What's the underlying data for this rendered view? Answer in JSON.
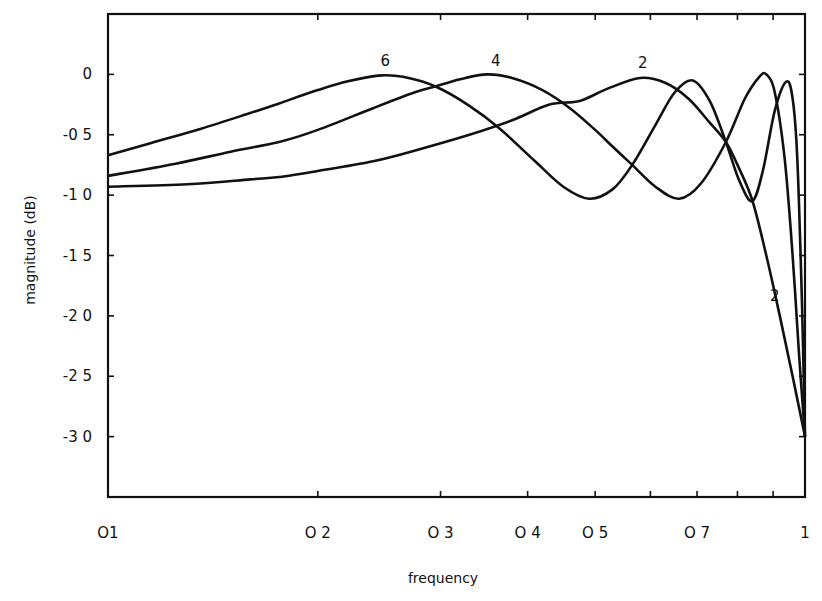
{
  "chart_data": {
    "type": "line",
    "title": "",
    "xlabel": "frequency",
    "ylabel": "magnitude (dB)",
    "xscale": "log",
    "xlim": [
      0.1,
      1.0
    ],
    "ylim": [
      -3.5,
      0.5
    ],
    "grid": false,
    "legend": "none (curves labeled inline)",
    "x_ticks": [
      0.1,
      0.2,
      0.3,
      0.4,
      0.5,
      0.6,
      0.7,
      0.8,
      0.9,
      1.0
    ],
    "x_tick_labels": [
      {
        "value": 0.1,
        "label": "O1"
      },
      {
        "value": 0.2,
        "label": "O 2"
      },
      {
        "value": 0.3,
        "label": "O 3"
      },
      {
        "value": 0.4,
        "label": "O 4"
      },
      {
        "value": 0.5,
        "label": "O 5"
      },
      {
        "value": 0.7,
        "label": "O 7"
      },
      {
        "value": 1.0,
        "label": "1"
      }
    ],
    "y_ticks": [
      0,
      -0.5,
      -1.0,
      -1.5,
      -2.0,
      -2.5,
      -3.0
    ],
    "y_tick_labels": [
      {
        "value": 0,
        "label": "0"
      },
      {
        "value": -0.5,
        "label": "-0 5"
      },
      {
        "value": -1.0,
        "label": "-1 0"
      },
      {
        "value": -1.5,
        "label": "-1 5"
      },
      {
        "value": -2.0,
        "label": "-2 0"
      },
      {
        "value": -2.5,
        "label": "-2 5"
      },
      {
        "value": -3.0,
        "label": "-3 0"
      }
    ],
    "series": [
      {
        "name": "6",
        "x": [
          0.1,
          0.115,
          0.136,
          0.16,
          0.176,
          0.2,
          0.22,
          0.244,
          0.265,
          0.295,
          0.33,
          0.365,
          0.41,
          0.45,
          0.49,
          0.53,
          0.565,
          0.61,
          0.65,
          0.69,
          0.73,
          0.77,
          0.805,
          0.84,
          0.87,
          0.905,
          0.94,
          0.96,
          0.975,
          0.99,
          1.0
        ],
        "values": [
          -0.67,
          -0.57,
          -0.45,
          -0.32,
          -0.24,
          -0.13,
          -0.06,
          -0.01,
          -0.02,
          -0.1,
          -0.26,
          -0.45,
          -0.72,
          -0.93,
          -1.03,
          -0.95,
          -0.75,
          -0.42,
          -0.15,
          -0.05,
          -0.22,
          -0.56,
          -0.88,
          -1.05,
          -0.8,
          -0.3,
          -0.06,
          -0.2,
          -0.7,
          -1.9,
          -3.0
        ]
      },
      {
        "name": "4",
        "x": [
          0.1,
          0.125,
          0.15,
          0.176,
          0.2,
          0.24,
          0.275,
          0.295,
          0.32,
          0.35,
          0.38,
          0.42,
          0.46,
          0.5,
          0.53,
          0.565,
          0.61,
          0.66,
          0.71,
          0.77,
          0.82,
          0.86,
          0.88,
          0.905,
          0.935,
          0.96,
          0.98,
          1.0
        ],
        "values": [
          -0.84,
          -0.74,
          -0.64,
          -0.56,
          -0.46,
          -0.28,
          -0.15,
          -0.1,
          -0.04,
          0.0,
          -0.03,
          -0.13,
          -0.28,
          -0.46,
          -0.6,
          -0.75,
          -0.93,
          -1.03,
          -0.9,
          -0.56,
          -0.2,
          -0.02,
          0.0,
          -0.15,
          -0.7,
          -1.5,
          -2.3,
          -3.0
        ]
      },
      {
        "name": "2",
        "x": [
          0.1,
          0.13,
          0.16,
          0.176,
          0.2,
          0.24,
          0.28,
          0.33,
          0.38,
          0.43,
          0.475,
          0.52,
          0.58,
          0.63,
          0.68,
          0.73,
          0.77,
          0.8,
          0.84,
          0.88,
          0.92,
          0.96,
          1.0
        ],
        "values": [
          -0.93,
          -0.91,
          -0.87,
          -0.85,
          -0.8,
          -0.72,
          -0.62,
          -0.5,
          -0.38,
          -0.25,
          -0.22,
          -0.12,
          -0.03,
          -0.07,
          -0.2,
          -0.4,
          -0.56,
          -0.75,
          -1.04,
          -1.5,
          -2.0,
          -2.5,
          -3.0
        ]
      }
    ],
    "annotations": [
      {
        "text": "6",
        "x": 0.25,
        "y": 0.07
      },
      {
        "text": "4",
        "x": 0.36,
        "y": 0.07
      },
      {
        "text": "2",
        "x": 0.585,
        "y": 0.05
      },
      {
        "text": "2",
        "x": 0.905,
        "y": -1.88
      }
    ]
  }
}
